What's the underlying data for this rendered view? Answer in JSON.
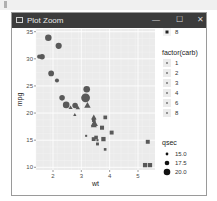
{
  "window": {
    "title": "Plot Zoom",
    "minimize_label": "—",
    "maximize_label": "☐",
    "close_label": "✕",
    "icon": "window-icon"
  },
  "chart_data": {
    "type": "scatter",
    "title": "",
    "xlabel": "wt",
    "ylabel": "mpg",
    "xlim": [
      1.4,
      5.6
    ],
    "ylim": [
      9.5,
      35.5
    ],
    "xticks": [
      2,
      3,
      4,
      5
    ],
    "yticks": [
      10,
      15,
      20,
      25,
      30,
      35
    ],
    "grid": true,
    "panel_background": "#ebebeb",
    "point_color": "#595959",
    "shape_legend": {
      "title": "factor(cyl)",
      "entries": [
        {
          "label": "8",
          "shape": "square"
        }
      ],
      "partially_visible": true
    },
    "carb_legend": {
      "title": "factor(carb)",
      "labels": [
        "1",
        "2",
        "3",
        "4",
        "6",
        "8"
      ]
    },
    "size_legend": {
      "title": "qsec",
      "labels": [
        "15.0",
        "17.5",
        "20.0"
      ],
      "values": [
        15.0,
        17.5,
        20.0
      ]
    },
    "legend_position": "right",
    "points": [
      {
        "wt": 2.62,
        "mpg": 21.0,
        "cyl": 6,
        "qsec": 16.46
      },
      {
        "wt": 2.875,
        "mpg": 21.0,
        "cyl": 6,
        "qsec": 17.02
      },
      {
        "wt": 2.32,
        "mpg": 22.8,
        "cyl": 4,
        "qsec": 18.61
      },
      {
        "wt": 3.215,
        "mpg": 21.4,
        "cyl": 6,
        "qsec": 19.44
      },
      {
        "wt": 3.44,
        "mpg": 18.7,
        "cyl": 8,
        "qsec": 17.02
      },
      {
        "wt": 3.46,
        "mpg": 18.1,
        "cyl": 6,
        "qsec": 20.22
      },
      {
        "wt": 3.57,
        "mpg": 14.3,
        "cyl": 8,
        "qsec": 15.84
      },
      {
        "wt": 3.19,
        "mpg": 24.4,
        "cyl": 4,
        "qsec": 20.0
      },
      {
        "wt": 3.15,
        "mpg": 22.8,
        "cyl": 4,
        "qsec": 22.9
      },
      {
        "wt": 3.44,
        "mpg": 19.2,
        "cyl": 6,
        "qsec": 18.3
      },
      {
        "wt": 3.44,
        "mpg": 17.8,
        "cyl": 6,
        "qsec": 18.9
      },
      {
        "wt": 4.07,
        "mpg": 16.4,
        "cyl": 8,
        "qsec": 17.4
      },
      {
        "wt": 3.73,
        "mpg": 17.3,
        "cyl": 8,
        "qsec": 17.6
      },
      {
        "wt": 3.78,
        "mpg": 15.2,
        "cyl": 8,
        "qsec": 18.0
      },
      {
        "wt": 5.25,
        "mpg": 10.4,
        "cyl": 8,
        "qsec": 17.98
      },
      {
        "wt": 5.424,
        "mpg": 10.4,
        "cyl": 8,
        "qsec": 17.82
      },
      {
        "wt": 5.345,
        "mpg": 14.7,
        "cyl": 8,
        "qsec": 17.42
      },
      {
        "wt": 2.2,
        "mpg": 32.4,
        "cyl": 4,
        "qsec": 19.47
      },
      {
        "wt": 1.615,
        "mpg": 30.4,
        "cyl": 4,
        "qsec": 18.52
      },
      {
        "wt": 1.835,
        "mpg": 33.9,
        "cyl": 4,
        "qsec": 19.9
      },
      {
        "wt": 2.465,
        "mpg": 21.5,
        "cyl": 4,
        "qsec": 20.01
      },
      {
        "wt": 3.52,
        "mpg": 15.5,
        "cyl": 8,
        "qsec": 16.87
      },
      {
        "wt": 3.435,
        "mpg": 15.2,
        "cyl": 8,
        "qsec": 17.3
      },
      {
        "wt": 3.84,
        "mpg": 13.3,
        "cyl": 8,
        "qsec": 15.41
      },
      {
        "wt": 3.845,
        "mpg": 19.2,
        "cyl": 8,
        "qsec": 17.05
      },
      {
        "wt": 1.935,
        "mpg": 27.3,
        "cyl": 4,
        "qsec": 18.9
      },
      {
        "wt": 2.14,
        "mpg": 26.0,
        "cyl": 4,
        "qsec": 16.7
      },
      {
        "wt": 1.513,
        "mpg": 30.4,
        "cyl": 4,
        "qsec": 16.9
      },
      {
        "wt": 3.17,
        "mpg": 15.8,
        "cyl": 8,
        "qsec": 14.5
      },
      {
        "wt": 2.77,
        "mpg": 19.7,
        "cyl": 6,
        "qsec": 15.5
      },
      {
        "wt": 3.57,
        "mpg": 15.0,
        "cyl": 8,
        "qsec": 14.6
      },
      {
        "wt": 2.78,
        "mpg": 21.4,
        "cyl": 4,
        "qsec": 18.6
      }
    ]
  }
}
